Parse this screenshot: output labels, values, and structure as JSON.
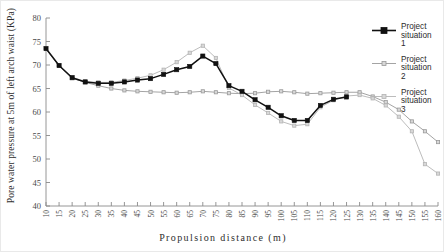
{
  "chart_data": {
    "type": "line",
    "title": "",
    "xlabel": "Propulsion distance (m)",
    "ylabel": "Pore water pressure at 5m of left arch waist (KPa)",
    "xlim": [
      10,
      160
    ],
    "ylim": [
      40,
      80
    ],
    "ytick_step": 5,
    "xtick_step": 5,
    "grid": false,
    "legend_position": "right",
    "x": [
      10,
      15,
      20,
      25,
      30,
      35,
      40,
      45,
      50,
      55,
      60,
      65,
      70,
      75,
      80,
      85,
      90,
      95,
      100,
      105,
      110,
      115,
      120,
      125,
      130,
      135,
      140,
      145,
      150,
      155,
      160
    ],
    "xticklabels": [
      "10",
      "15",
      "20",
      "25",
      "30",
      "35",
      "40",
      "45",
      "50",
      "55",
      "60",
      "65",
      "70",
      "75",
      "80",
      "85",
      "90",
      "95",
      "100",
      "105",
      "110",
      "115",
      "120",
      "125",
      "130",
      "135",
      "140",
      "145",
      "150",
      "155",
      "160"
    ],
    "yticklabels": [
      "40",
      "45",
      "50",
      "55",
      "60",
      "65",
      "70",
      "75",
      "80"
    ],
    "series": [
      {
        "name": "Project situation 1",
        "color": "#111111",
        "marker": "square-filled",
        "values": [
          73.5,
          69.9,
          67.3,
          66.4,
          66.1,
          66.1,
          66.4,
          66.8,
          67.1,
          68.0,
          69.0,
          69.7,
          71.9,
          70.3,
          65.6,
          64.4,
          62.6,
          61.0,
          59.2,
          58.2,
          58.2,
          61.4,
          62.7,
          63.2,
          null,
          null,
          null,
          null,
          null,
          null,
          null
        ]
      },
      {
        "name": "Project situation 2",
        "color": "#9a9a9a",
        "marker": "square-light",
        "values": [
          73.4,
          69.8,
          67.2,
          66.3,
          65.6,
          65.0,
          64.6,
          64.4,
          64.3,
          64.2,
          64.1,
          64.2,
          64.4,
          64.2,
          64.0,
          63.9,
          64.0,
          64.3,
          64.4,
          64.2,
          63.9,
          64.0,
          64.1,
          64.2,
          64.2,
          63.3,
          62.1,
          60.5,
          58.0,
          55.9,
          53.6
        ]
      },
      {
        "name": "Project situation 3",
        "color": "#b4b4b4",
        "marker": "square-light",
        "values": [
          73.4,
          69.9,
          67.4,
          66.5,
          66.3,
          66.3,
          66.7,
          67.2,
          67.8,
          69.0,
          70.6,
          72.6,
          74.1,
          71.5,
          65.1,
          63.6,
          61.5,
          59.8,
          58.0,
          57.1,
          57.4,
          61.0,
          62.5,
          63.4,
          63.6,
          62.9,
          61.4,
          59.0,
          55.9,
          48.9,
          46.9
        ]
      }
    ],
    "legend": [
      {
        "label_line1": "Project",
        "label_line2": "situation",
        "label_line3": "1"
      },
      {
        "label_line1": "Project",
        "label_line2": "situation",
        "label_line3": "2"
      },
      {
        "label_line1": "Project",
        "label_line2": "situation",
        "label_line3": "3"
      }
    ]
  }
}
